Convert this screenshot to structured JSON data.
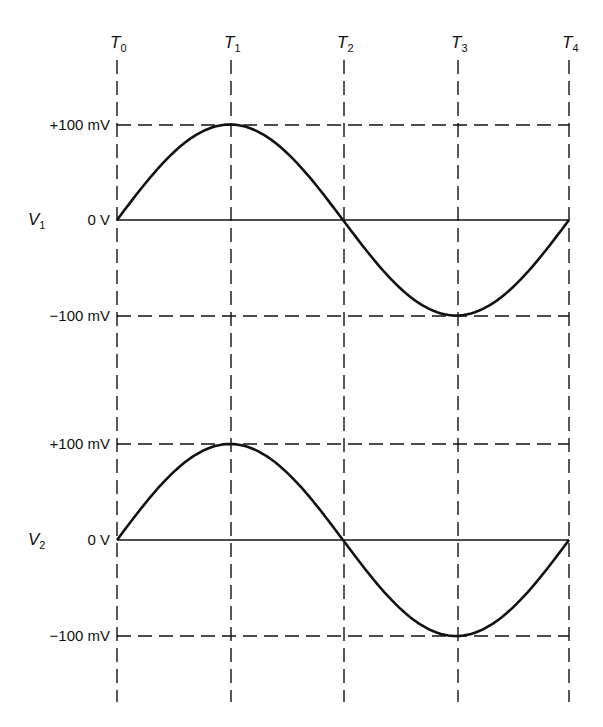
{
  "chart_data": {
    "type": "line",
    "title": "",
    "xlabel": "Time",
    "x_ticks": [
      "T0",
      "T1",
      "T2",
      "T3",
      "T4"
    ],
    "grid": "dashed",
    "panels": [
      {
        "name": "V1",
        "label_main": "V",
        "label_sub": "1",
        "ylabel": "V1",
        "y_ticks": [
          "+100 mV",
          "0 V",
          "-100 mV"
        ],
        "ylim_mV": [
          -100,
          100
        ],
        "series": [
          {
            "name": "V1",
            "x": [
              "T0",
              "T1",
              "T2",
              "T3",
              "T4"
            ],
            "values_mV": [
              0,
              100,
              0,
              -100,
              0
            ],
            "shape": "sine"
          }
        ]
      },
      {
        "name": "V2",
        "label_main": "V",
        "label_sub": "2",
        "ylabel": "V2",
        "y_ticks": [
          "+100 mV",
          "0 V",
          "-100 mV"
        ],
        "ylim_mV": [
          -100,
          100
        ],
        "series": [
          {
            "name": "V2",
            "x": [
              "T0",
              "T1",
              "T2",
              "T3",
              "T4"
            ],
            "values_mV": [
              0,
              100,
              0,
              -100,
              0
            ],
            "shape": "sine"
          }
        ]
      }
    ]
  },
  "labels": {
    "t": [
      {
        "main": "T",
        "sub": "0"
      },
      {
        "main": "T",
        "sub": "1"
      },
      {
        "main": "T",
        "sub": "2"
      },
      {
        "main": "T",
        "sub": "3"
      },
      {
        "main": "T",
        "sub": "4"
      }
    ],
    "panel1": {
      "v_main": "V",
      "v_sub": "1",
      "plus": "+100 mV",
      "zero": "0 V",
      "minus": "−100 mV"
    },
    "panel2": {
      "v_main": "V",
      "v_sub": "2",
      "plus": "+100 mV",
      "zero": "0 V",
      "minus": "−100 mV"
    }
  },
  "colors": {
    "ink": "#111111",
    "background": "#ffffff"
  }
}
